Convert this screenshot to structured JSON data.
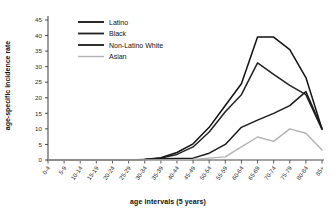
{
  "chart_data": {
    "type": "line",
    "title": "",
    "xlabel": "age intervals (5 years)",
    "ylabel": "age-specific incidence rate",
    "categories": [
      "0-4",
      "5-9",
      "10-14",
      "15-19",
      "20-24",
      "25-29",
      "30-34",
      "35-39",
      "40-44",
      "45-49",
      "50-54",
      "55-59",
      "60-64",
      "65-69",
      "70-74",
      "75-79",
      "80-84",
      "85+"
    ],
    "ylim": [
      0,
      45
    ],
    "yticks": [
      0,
      5,
      10,
      15,
      20,
      25,
      30,
      35,
      40,
      45
    ],
    "grid": false,
    "legend_position": "top-left",
    "series": [
      {
        "name": "Latino",
        "color": "#111111",
        "values": [
          0,
          0,
          0,
          0,
          0,
          0,
          0.2,
          0.7,
          2.4,
          5.2,
          10.5,
          17.5,
          24.5,
          39.5,
          39.5,
          35.5,
          26.5,
          10.0
        ]
      },
      {
        "name": "Black",
        "color": "#222222",
        "values": [
          0,
          0,
          0,
          0,
          0,
          0,
          0.2,
          0.6,
          1.8,
          4.2,
          9.0,
          15.5,
          21.0,
          31.2,
          27.5,
          24.0,
          21.0,
          9.8
        ]
      },
      {
        "name": "Non-Latino White",
        "color": "#1a1a1a",
        "values": [
          0,
          0,
          0,
          0,
          0,
          0,
          0.2,
          0.4,
          0.5,
          0.6,
          2.2,
          5.0,
          10.5,
          12.8,
          15.0,
          17.5,
          22.0,
          10.2
        ]
      },
      {
        "name": "Asian",
        "color": "#b3b3b3",
        "values": [
          0,
          0,
          0,
          0,
          0,
          0,
          0,
          0,
          0,
          0.2,
          0.6,
          1.0,
          4.2,
          7.4,
          6.0,
          10.0,
          8.6,
          3.2
        ]
      }
    ]
  },
  "legend": {
    "items": [
      {
        "label": "Latino"
      },
      {
        "label": "Black"
      },
      {
        "label": "Non-Latino White"
      },
      {
        "label": "Asian"
      }
    ]
  }
}
